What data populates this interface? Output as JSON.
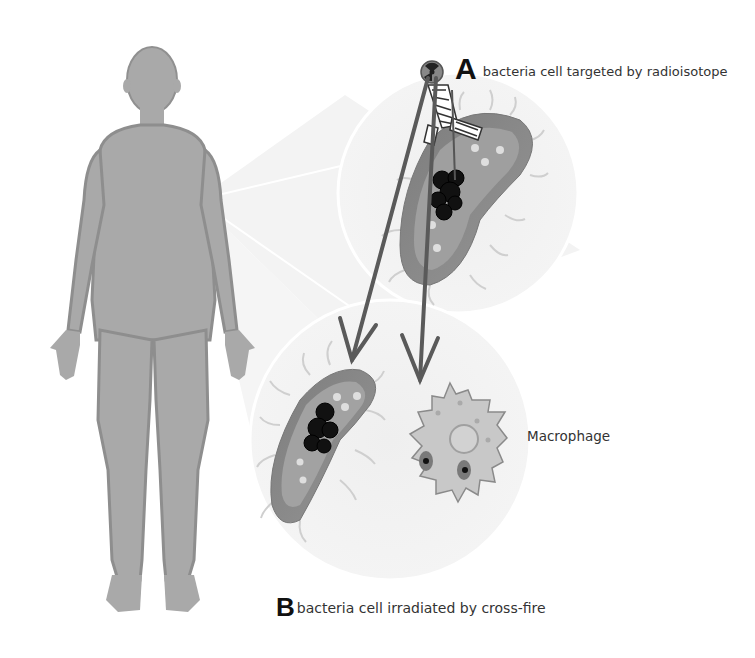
{
  "figure": {
    "panel_a": {
      "letter": "A",
      "caption": "bacteria cell targeted by radioisotope"
    },
    "panel_b": {
      "letter": "B",
      "caption": "bacteria cell irradiated by cross-fire"
    },
    "cell_labels": {
      "macrophage": "Macrophage"
    },
    "elements": {
      "human_body": "human-body-silhouette",
      "radioisotope": "radiation-icon",
      "antibody": "antibody-icon",
      "bacteria_targeted": "bacteria-cell",
      "bacteria_crossfire": "bacteria-cell",
      "macrophage": "macrophage-cell",
      "arrows": [
        "radiation-arrow",
        "radiation-arrow"
      ]
    },
    "colors": {
      "body_fill": "#a9a9a9",
      "body_outline": "#8c8c8c",
      "zoom_circle": "#f0f0f0",
      "bacteria_fill": "#8a8a8a",
      "bacteria_inner": "#a6a6a6",
      "arrow": "#5a5a5a",
      "dna_cluster": "#111111",
      "macrophage_fill": "#c8c8c8",
      "text": "#333333"
    }
  }
}
